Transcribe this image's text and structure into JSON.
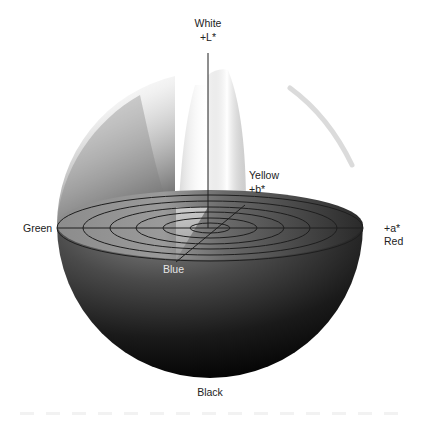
{
  "diagram": {
    "type": "hemisphere-color-solid",
    "axes": {
      "L": {
        "top_label": "White",
        "top_sublabel": "+L*",
        "bottom_label": "Black"
      },
      "a": {
        "positive_label": "+a*",
        "positive_name": "Red",
        "negative_name": "Green"
      },
      "b": {
        "positive_label": "+b*",
        "positive_name": "Yellow",
        "negative_name": "Blue"
      }
    },
    "concentric_rings": 6,
    "colors": {
      "background": "#ffffff",
      "line": "#1e1e1e",
      "label_text": "#222222",
      "blue_label_text": "#e6e6e6",
      "sphere_dark": "#050505",
      "sphere_mid": "#5a5a5a",
      "sphere_light": "#f2f2f2"
    }
  }
}
